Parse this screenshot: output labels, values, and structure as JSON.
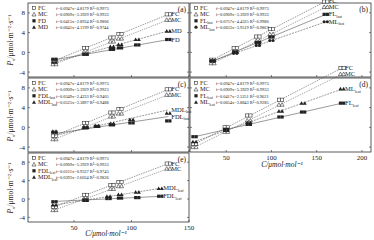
{
  "chart_data": [
    {
      "panel": "a",
      "type": "scatter",
      "xlabel": "",
      "ylabel": "P_n/μmol·m⁻²·s⁻¹",
      "xlim": [
        10,
        150
      ],
      "ylim": [
        -5,
        10
      ],
      "yticks": [
        -4,
        0,
        4,
        8
      ],
      "xticks": [
        50,
        100
      ],
      "series": [
        {
          "name": "FC",
          "marker": "open-square",
          "equation": "f=0.0947x−4.8179",
          "r2": "R²=0.9973",
          "x": [
            33,
            60,
            83,
            90,
            132
          ],
          "y": [
            -1.7,
            0.9,
            3.0,
            3.7,
            7.7
          ],
          "end_label": "FC"
        },
        {
          "name": "MC",
          "marker": "open-triangle",
          "equation": "f=0.0909x−5.3929",
          "r2": "R²=0.9933",
          "x": [
            33,
            60,
            83,
            90,
            132
          ],
          "y": [
            -2.4,
            0.1,
            2.2,
            2.8,
            6.6
          ],
          "end_label": "MC"
        },
        {
          "name": "FD",
          "marker": "filled-square",
          "equation": "f=0.0415x−2.8934",
          "r2": "R²=0.9806",
          "x": [
            33,
            60,
            83,
            90,
            105,
            132
          ],
          "y": [
            -1.4,
            -0.4,
            0.6,
            0.9,
            1.5,
            2.6
          ],
          "end_label": "FD"
        },
        {
          "name": "MD",
          "marker": "filled-triangle",
          "equation": "f=0.0641x−4.1199",
          "r2": "R²=0.9744",
          "x": [
            33,
            60,
            83,
            90,
            105,
            132
          ],
          "y": [
            -2.0,
            -0.3,
            1.2,
            1.6,
            2.6,
            4.3
          ],
          "end_label": "MD"
        }
      ]
    },
    {
      "panel": "b",
      "type": "scatter",
      "xlabel": "",
      "ylabel": "",
      "xlim": [
        10,
        210
      ],
      "ylim": [
        -5,
        10
      ],
      "xticks": [
        50,
        100,
        150,
        200
      ],
      "series": [
        {
          "name": "FC",
          "marker": "open-square",
          "equation": "f=0.0947x−4.8179",
          "r2": "R²=0.9973",
          "x": [
            35,
            60,
            85,
            100,
            160
          ],
          "y": [
            -1.5,
            0.9,
            3.2,
            4.7,
            10.3
          ],
          "end_label": "FC"
        },
        {
          "name": "MC",
          "marker": "open-triangle",
          "equation": "f=0.0909x−5.3929",
          "r2": "R²=0.9933",
          "x": [
            35,
            60,
            85,
            100,
            160
          ],
          "y": [
            -2.2,
            0.1,
            2.3,
            3.7,
            9.2
          ],
          "end_label": "MC"
        },
        {
          "name": "FL_last",
          "label_main": "FL",
          "label_sub": "last",
          "marker": "filled-square",
          "equation": "f=0.0757x−4.4325",
          "r2": "R²=0.9980",
          "x": [
            35,
            60,
            85,
            100,
            160
          ],
          "y": [
            -1.8,
            0.1,
            2.0,
            3.1,
            7.7
          ],
          "end_label": "FL_last"
        },
        {
          "name": "ML_last",
          "label_main": "ML",
          "label_sub": "last",
          "marker": "filled-circle",
          "equation": "f=0.0633x−3.9519",
          "r2": "R²=0.9867",
          "x": [
            35,
            60,
            85,
            100,
            160
          ],
          "y": [
            -1.7,
            -0.2,
            1.4,
            2.4,
            6.2
          ],
          "end_label": "ML_last"
        }
      ]
    },
    {
      "panel": "c",
      "type": "scatter",
      "xlabel": "",
      "ylabel": "P_n/μmol·m⁻²·s⁻¹",
      "xlim": [
        10,
        150
      ],
      "ylim": [
        -5,
        10
      ],
      "yticks": [
        -4,
        0,
        4,
        8
      ],
      "series": [
        {
          "name": "FC",
          "marker": "open-square",
          "equation": "f=0.0947x−4.8179",
          "r2": "R²=0.9973",
          "x": [
            33,
            60,
            83,
            90,
            132
          ],
          "y": [
            -1.7,
            0.9,
            3.0,
            3.7,
            7.7
          ],
          "end_label": "FC"
        },
        {
          "name": "MC",
          "marker": "open-triangle",
          "equation": "f=0.0909x−5.3929",
          "r2": "R²=0.9923",
          "x": [
            33,
            60,
            83,
            90,
            132
          ],
          "y": [
            -2.4,
            0.1,
            2.2,
            2.8,
            6.6
          ],
          "end_label": "MC"
        },
        {
          "name": "FDL_last",
          "label_main": "FDL",
          "label_sub": "last",
          "marker": "filled-square",
          "equation": "f=0.0349x−2.4233",
          "r2": "R²=0.9405",
          "x": [
            33,
            60,
            70,
            83,
            100,
            132
          ],
          "y": [
            -1.0,
            -0.1,
            0.2,
            0.5,
            0.9,
            1.3
          ],
          "end_label": "FDL_last"
        },
        {
          "name": "MDL_last",
          "label_main": "MDL",
          "label_sub": "last",
          "marker": "filled-triangle",
          "equation": "f=0.0525x−3.3897",
          "r2": "R²=0.9488",
          "x": [
            33,
            60,
            70,
            83,
            100,
            132
          ],
          "y": [
            -0.8,
            0.0,
            0.3,
            0.8,
            1.6,
            2.9
          ],
          "end_label": "MDL_last"
        }
      ]
    },
    {
      "panel": "d",
      "type": "scatter",
      "xlabel": "C/μmol·mol⁻¹",
      "ylabel": "",
      "xlim": [
        10,
        210
      ],
      "ylim": [
        -5,
        10
      ],
      "xticks": [
        50,
        100,
        150,
        200
      ],
      "series": [
        {
          "name": "FC",
          "marker": "open-square",
          "equation": "f=0.0947x−4.8179",
          "r2": "R²=0.9973",
          "x": [
            15,
            50,
            75,
            110,
            178
          ],
          "y": [
            -3.4,
            0.0,
            2.4,
            5.6,
            12.0
          ],
          "end_label": "FC"
        },
        {
          "name": "MC",
          "marker": "open-triangle",
          "equation": "f=0.0909x−5.3929",
          "r2": "R²=0.9933",
          "x": [
            15,
            50,
            75,
            110,
            178
          ],
          "y": [
            -4.0,
            -0.9,
            1.4,
            4.6,
            10.8
          ],
          "end_label": "MC"
        },
        {
          "name": "FL_leaf",
          "label_main": "FL",
          "label_sub": "leaf",
          "marker": "filled-square",
          "equation": "f=0.0417x−2.5251",
          "r2": "R²=0.9621",
          "x": [
            15,
            50,
            75,
            110,
            135,
            178
          ],
          "y": [
            -1.9,
            -0.4,
            0.6,
            2.1,
            3.1,
            4.9
          ],
          "end_label": "FL_leaf"
        },
        {
          "name": "ML_leaf",
          "label_main": "ML",
          "label_sub": "leaf",
          "marker": "filled-triangle",
          "equation": "f=0.0654x−3.8843",
          "r2": "R²=0.9285",
          "x": [
            15,
            50,
            75,
            110,
            135,
            178
          ],
          "y": [
            -2.9,
            -0.6,
            1.0,
            3.3,
            4.9,
            7.8
          ],
          "end_label": "ML_leaf"
        }
      ]
    },
    {
      "panel": "e",
      "type": "scatter",
      "xlabel": "C/μmol·mol⁻¹",
      "ylabel": "P_n/μmol·m⁻²·s⁻¹",
      "xlim": [
        10,
        150
      ],
      "ylim": [
        -5,
        10
      ],
      "yticks": [
        -4,
        0,
        4,
        8
      ],
      "xticks": [
        50,
        100,
        150
      ],
      "series": [
        {
          "name": "FC",
          "marker": "open-square",
          "equation": "f=0.0947x−4.8179",
          "r2": "R²=0.9973",
          "x": [
            33,
            60,
            83,
            90,
            132
          ],
          "y": [
            -1.7,
            0.9,
            3.0,
            3.7,
            7.7
          ],
          "end_label": "FC"
        },
        {
          "name": "MC",
          "marker": "open-triangle",
          "equation": "f=0.0909x−5.3929",
          "r2": "R²=0.9933",
          "x": [
            33,
            60,
            83,
            90,
            132
          ],
          "y": [
            -2.4,
            0.1,
            2.2,
            2.8,
            6.6
          ],
          "end_label": "MC"
        },
        {
          "name": "FDL_leaf",
          "label_main": "FDL",
          "label_sub": "leaf",
          "marker": "filled-square",
          "equation": "f=0.0121x−0.9337",
          "r2": "R²=0.9743",
          "x": [
            33,
            60,
            80,
            90,
            105,
            125
          ],
          "y": [
            -0.6,
            -0.2,
            0.1,
            0.2,
            0.3,
            0.6
          ],
          "end_label": "FDL_leaf"
        },
        {
          "name": "MDL_leaf",
          "label_main": "MDL",
          "label_sub": "leaf",
          "marker": "filled-triangle",
          "equation": "f=0.0393x−2.6034",
          "r2": "R²=0.9826",
          "x": [
            33,
            60,
            80,
            90,
            105,
            125
          ],
          "y": [
            -1.3,
            -0.3,
            0.6,
            1.0,
            1.5,
            2.3
          ],
          "end_label": "MDL_leaf"
        }
      ]
    }
  ],
  "labels": {
    "a": "(a)",
    "b": "(b)",
    "c": "(c)",
    "d": "(d)",
    "e": "(e)",
    "ylabel": "P",
    "ylabel_sub": "n",
    "ylabel_unit": "/μmol·m⁻²·s⁻¹",
    "xlabel": "C/μmol·mol⁻¹",
    "ticks_y": [
      "8",
      "4",
      "0",
      "-4"
    ],
    "ticks_x_left": [
      "50",
      "100",
      "150"
    ],
    "ticks_x_right": [
      "50",
      "100",
      "150",
      "200"
    ]
  }
}
